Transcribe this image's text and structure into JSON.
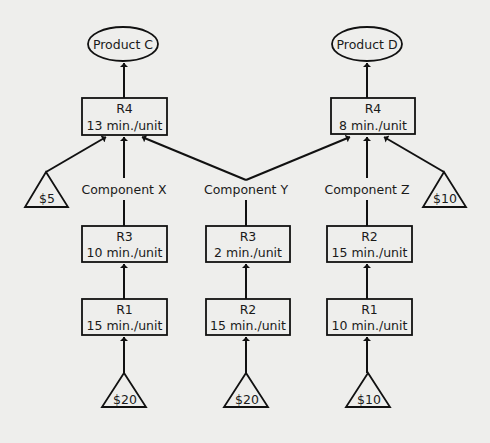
{
  "diagram": {
    "products": [
      {
        "id": "product-c",
        "label": "Product C"
      },
      {
        "id": "product-d",
        "label": "Product D"
      }
    ],
    "resources": {
      "r4_c": {
        "name": "R4",
        "time": "13 min./unit"
      },
      "r4_d": {
        "name": "R4",
        "time": "8 min./unit"
      },
      "r3_x": {
        "name": "R3",
        "time": "10 min./unit"
      },
      "r3_y": {
        "name": "R3",
        "time": "2 min./unit"
      },
      "r2_z": {
        "name": "R2",
        "time": "15 min./unit"
      },
      "r1_x": {
        "name": "R1",
        "time": "15 min./unit"
      },
      "r2_y": {
        "name": "R2",
        "time": "15 min./unit"
      },
      "r1_z": {
        "name": "R1",
        "time": "10 min./unit"
      }
    },
    "components": {
      "x": "Component X",
      "y": "Component Y",
      "z": "Component Z"
    },
    "materials": {
      "c_extra": "$5",
      "d_extra": "$10",
      "x_raw": "$20",
      "y_raw": "$20",
      "z_raw": "$10"
    },
    "edges": [
      [
        "r4_c",
        "product-c"
      ],
      [
        "r4_d",
        "product-d"
      ],
      [
        "c_extra",
        "r4_c"
      ],
      [
        "component-x",
        "r4_c"
      ],
      [
        "component-y",
        "r4_c"
      ],
      [
        "component-y",
        "r4_d"
      ],
      [
        "component-z",
        "r4_d"
      ],
      [
        "d_extra",
        "r4_d"
      ],
      [
        "r3_x",
        "component-x"
      ],
      [
        "r3_y",
        "component-y"
      ],
      [
        "r2_z",
        "component-z"
      ],
      [
        "r1_x",
        "r3_x"
      ],
      [
        "r2_y",
        "r3_y"
      ],
      [
        "r1_z",
        "r2_z"
      ],
      [
        "x_raw",
        "r1_x"
      ],
      [
        "y_raw",
        "r2_y"
      ],
      [
        "z_raw",
        "r1_z"
      ]
    ]
  }
}
